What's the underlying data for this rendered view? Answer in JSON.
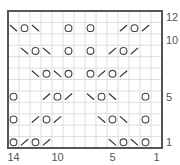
{
  "chart_data": {
    "type": "knitting-chart",
    "title": "",
    "columns": 14,
    "rows": 12,
    "column_labels": [
      "14",
      "10",
      "5",
      "1"
    ],
    "column_label_values": [
      14,
      10,
      5,
      1
    ],
    "row_labels": [
      "12",
      "10",
      "5",
      "1"
    ],
    "row_label_values": [
      12,
      10,
      5,
      1
    ],
    "symbol_legend": {
      "yo": "yarn over (circle)",
      "k2tog": "right-leaning decrease (/)",
      "ssk": "left-leaning decrease (\\)"
    },
    "cells": [
      {
        "row": 11,
        "col": 14,
        "symbol": "ssk"
      },
      {
        "row": 11,
        "col": 13,
        "symbol": "yo"
      },
      {
        "row": 11,
        "col": 12,
        "symbol": "ssk"
      },
      {
        "row": 11,
        "col": 9,
        "symbol": "yo"
      },
      {
        "row": 11,
        "col": 7,
        "symbol": "yo"
      },
      {
        "row": 11,
        "col": 4,
        "symbol": "k2tog"
      },
      {
        "row": 11,
        "col": 3,
        "symbol": "yo"
      },
      {
        "row": 11,
        "col": 2,
        "symbol": "k2tog"
      },
      {
        "row": 9,
        "col": 13,
        "symbol": "ssk"
      },
      {
        "row": 9,
        "col": 12,
        "symbol": "yo"
      },
      {
        "row": 9,
        "col": 11,
        "symbol": "ssk"
      },
      {
        "row": 9,
        "col": 9,
        "symbol": "yo"
      },
      {
        "row": 9,
        "col": 7,
        "symbol": "yo"
      },
      {
        "row": 9,
        "col": 5,
        "symbol": "k2tog"
      },
      {
        "row": 9,
        "col": 4,
        "symbol": "yo"
      },
      {
        "row": 9,
        "col": 3,
        "symbol": "k2tog"
      },
      {
        "row": 7,
        "col": 12,
        "symbol": "ssk"
      },
      {
        "row": 7,
        "col": 11,
        "symbol": "yo"
      },
      {
        "row": 7,
        "col": 10,
        "symbol": "ssk"
      },
      {
        "row": 7,
        "col": 9,
        "symbol": "yo"
      },
      {
        "row": 7,
        "col": 7,
        "symbol": "yo"
      },
      {
        "row": 7,
        "col": 6,
        "symbol": "k2tog"
      },
      {
        "row": 7,
        "col": 5,
        "symbol": "yo"
      },
      {
        "row": 7,
        "col": 4,
        "symbol": "k2tog"
      },
      {
        "row": 5,
        "col": 14,
        "symbol": "yo"
      },
      {
        "row": 5,
        "col": 11,
        "symbol": "k2tog"
      },
      {
        "row": 5,
        "col": 10,
        "symbol": "yo"
      },
      {
        "row": 5,
        "col": 9,
        "symbol": "k2tog"
      },
      {
        "row": 5,
        "col": 7,
        "symbol": "ssk"
      },
      {
        "row": 5,
        "col": 6,
        "symbol": "yo"
      },
      {
        "row": 5,
        "col": 5,
        "symbol": "ssk"
      },
      {
        "row": 5,
        "col": 2,
        "symbol": "yo"
      },
      {
        "row": 3,
        "col": 14,
        "symbol": "yo"
      },
      {
        "row": 3,
        "col": 12,
        "symbol": "k2tog"
      },
      {
        "row": 3,
        "col": 11,
        "symbol": "yo"
      },
      {
        "row": 3,
        "col": 10,
        "symbol": "k2tog"
      },
      {
        "row": 3,
        "col": 6,
        "symbol": "ssk"
      },
      {
        "row": 3,
        "col": 5,
        "symbol": "yo"
      },
      {
        "row": 3,
        "col": 4,
        "symbol": "ssk"
      },
      {
        "row": 3,
        "col": 2,
        "symbol": "yo"
      },
      {
        "row": 1,
        "col": 14,
        "symbol": "yo"
      },
      {
        "row": 1,
        "col": 13,
        "symbol": "k2tog"
      },
      {
        "row": 1,
        "col": 12,
        "symbol": "yo"
      },
      {
        "row": 1,
        "col": 11,
        "symbol": "k2tog"
      },
      {
        "row": 1,
        "col": 5,
        "symbol": "ssk"
      },
      {
        "row": 1,
        "col": 4,
        "symbol": "yo"
      },
      {
        "row": 1,
        "col": 3,
        "symbol": "ssk"
      },
      {
        "row": 1,
        "col": 2,
        "symbol": "yo"
      }
    ],
    "colors": {
      "grid": "#d6d6d6",
      "border": "#555555",
      "symbol": "#333333",
      "label": "#555555"
    }
  }
}
